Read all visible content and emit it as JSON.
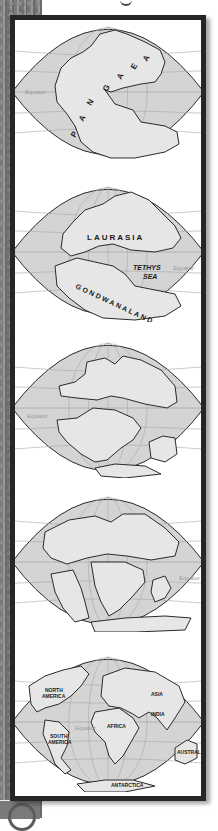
{
  "figure": {
    "colors": {
      "ocean": "#d4d4d4",
      "land": "#e6e6e6",
      "coast": "#2a2a2a",
      "grid": "#a8a8a8",
      "frame": "#262626",
      "equator_label": "#9a9a9a"
    },
    "panels": [
      {
        "id": "pangaea",
        "equator_label": "Equator",
        "equator_side": "left",
        "labels": [
          "P",
          "A",
          "N",
          "G",
          "A",
          "E",
          "A"
        ]
      },
      {
        "id": "laurasia-gondwana",
        "equator_label": "Equator",
        "equator_side": "right",
        "labels": {
          "north": "LAURASIA",
          "sea_line1": "TETHYS",
          "sea_line2": "SEA",
          "south": "GONDWANALAND"
        }
      },
      {
        "id": "breakup-1",
        "equator_label": "Equator",
        "equator_side": "left",
        "labels": {}
      },
      {
        "id": "breakup-2",
        "equator_label": "Equator",
        "equator_side": "right",
        "labels": {}
      },
      {
        "id": "present-day",
        "equator_label": "Equator",
        "equator_side": "center",
        "labels": {
          "north_america_1": "NORTH",
          "north_america_2": "AMERICA",
          "south_america_1": "SOUTH",
          "south_america_2": "AMERICA",
          "africa": "AFRICA",
          "asia": "ASIA",
          "india": "INDIA",
          "australia": "AUSTRALIA",
          "antarctica": "ANTARCTICA"
        }
      }
    ]
  }
}
